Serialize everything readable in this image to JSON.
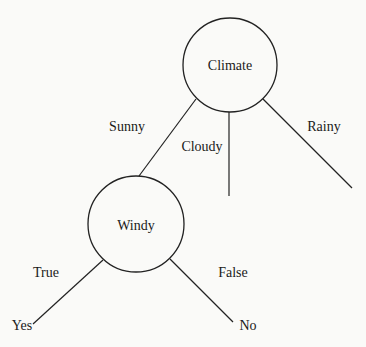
{
  "nodes": {
    "root": {
      "label": "Climate",
      "cx": 230,
      "cy": 65,
      "r": 47
    },
    "windy": {
      "label": "Windy",
      "cx": 136,
      "cy": 224,
      "r": 48
    }
  },
  "edges": [
    {
      "from": "Climate",
      "label": "Sunny",
      "to": "Windy"
    },
    {
      "from": "Climate",
      "label": "Cloudy",
      "to": ""
    },
    {
      "from": "Climate",
      "label": "Rainy",
      "to": ""
    },
    {
      "from": "Windy",
      "label": "True",
      "to": "Yes"
    },
    {
      "from": "Windy",
      "label": "False",
      "to": "No"
    }
  ],
  "leaves": {
    "yes": "Yes",
    "no": "No"
  },
  "colors": {
    "stroke": "#222222",
    "text": "#1a1a1a",
    "background": "#fafaf8"
  }
}
